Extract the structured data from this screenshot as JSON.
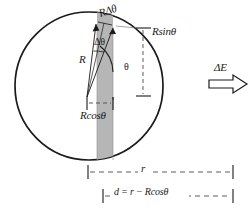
{
  "figure": {
    "type": "geometry-diagram",
    "background_color": "#ffffff",
    "stroke_color": "#1a1a1a",
    "shaded_strip_color": "#b5b5b5",
    "dashed_color": "#555555"
  },
  "labels": {
    "arc_element": "RΔθ",
    "vertical_height": "Rsinθ",
    "angle_increment": "Δθ",
    "radius": "R",
    "angle": "θ",
    "horizontal_projection": "Rcosθ",
    "outer_distance": "r",
    "distance_relation": "d = r − Rcosθ",
    "field_increment": "ΔE"
  },
  "geometry": {
    "circle": {
      "center_x": 89,
      "center_y": 86,
      "radius": 74,
      "stroke_width": 1.6
    },
    "apex": {
      "x": 87,
      "y": 97
    },
    "strip": {
      "left_x": 97,
      "right_x": 113,
      "top_y": 25,
      "bottom_y": 160,
      "fill": "#b5b5b5"
    },
    "radii_lines": [
      {
        "label": "R",
        "to_x": 97,
        "to_y": 24
      },
      {
        "label": "R-plus-dtheta",
        "to_x": 113,
        "to_y": 27
      }
    ],
    "dimension_lines": [
      {
        "name": "Rsin-theta-vertical",
        "x": 143,
        "y_top": 27,
        "y_bottom": 97
      },
      {
        "name": "Rcos-theta-horizontal",
        "y": 103,
        "x_left": 87,
        "x_right": 113
      },
      {
        "name": "r-horizontal",
        "y": 172,
        "x_left": 88,
        "x_right": 233
      },
      {
        "name": "d-horizontal",
        "y": 196,
        "x_left": 103,
        "x_right": 233
      }
    ],
    "field_arrow": {
      "x_start": 209,
      "x_end": 247,
      "y_center": 84,
      "shaft_half_height": 4,
      "head_half_height": 9
    }
  }
}
